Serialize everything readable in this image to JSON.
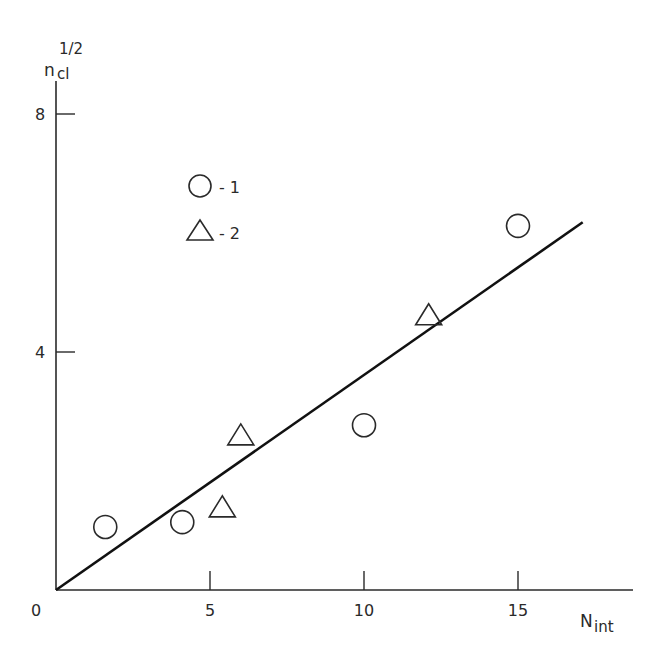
{
  "chart_data": {
    "type": "scatter",
    "title": "",
    "xlabel": "N",
    "xlabel_sub": "int",
    "ylabel": "n",
    "ylabel_sub": "cl",
    "ylabel_sup": "1/2",
    "xlim": [
      0,
      18.5
    ],
    "ylim": [
      0,
      9
    ],
    "xticks": [
      5,
      10,
      15
    ],
    "yticks": [
      4,
      8
    ],
    "origin_label": "0",
    "grid": false,
    "legend_position": "upper-left",
    "legend": [
      {
        "marker": "circle",
        "label": "- 1"
      },
      {
        "marker": "triangle",
        "label": "- 2"
      }
    ],
    "series": [
      {
        "name": "1",
        "marker": "circle",
        "points": [
          {
            "x": 1.6,
            "y": 1.06
          },
          {
            "x": 4.1,
            "y": 1.14
          },
          {
            "x": 10.0,
            "y": 2.77
          },
          {
            "x": 15.0,
            "y": 6.12
          }
        ]
      },
      {
        "name": "2",
        "marker": "triangle",
        "points": [
          {
            "x": 5.4,
            "y": 1.38
          },
          {
            "x": 6.0,
            "y": 2.59
          },
          {
            "x": 12.1,
            "y": 4.61
          }
        ]
      }
    ],
    "fit_line": {
      "x0": 0,
      "y0": 0,
      "x1": 17.1,
      "y1": 6.18
    }
  }
}
